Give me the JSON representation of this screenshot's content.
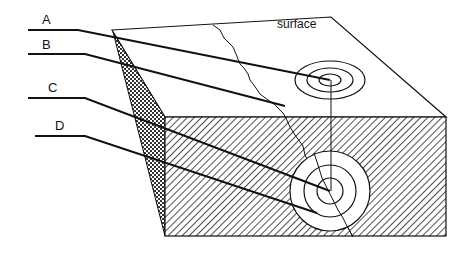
{
  "diagram": {
    "type": "earthquake-block-diagram",
    "labels": [
      {
        "id": "A",
        "text": "A",
        "x": 42,
        "y": 12
      },
      {
        "id": "B",
        "text": "B",
        "x": 42,
        "y": 37
      },
      {
        "id": "C",
        "text": "C",
        "x": 48,
        "y": 80
      },
      {
        "id": "D",
        "text": "D",
        "x": 55,
        "y": 118
      }
    ],
    "surface_label": "surface",
    "colors": {
      "stroke": "#111111",
      "background": "#ffffff"
    }
  }
}
